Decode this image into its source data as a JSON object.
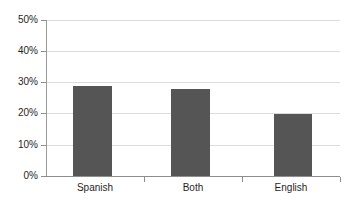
{
  "chart_data": {
    "type": "bar",
    "title": "",
    "xlabel": "",
    "ylabel": "",
    "categories": [
      "Spanish",
      "Both",
      "English"
    ],
    "values": [
      29,
      28,
      20
    ],
    "value_labels": [
      "29%",
      "28%",
      "20%"
    ],
    "series": [
      {
        "name": "",
        "values": [
          29,
          28,
          20
        ]
      }
    ],
    "ylim": [
      0,
      50
    ],
    "ytick_values": [
      50,
      40,
      30,
      20,
      10,
      0
    ],
    "ytick_labels": [
      "50%",
      "40%",
      "30%",
      "20%",
      "10%",
      "0%"
    ],
    "grid": true,
    "grid_axis": "y",
    "legend": false,
    "legend_position": "none",
    "bar_color": "#555555",
    "gridline_color": "#dcdcdc",
    "axis_color": "#8e8e8e",
    "background_color": "#ffffff"
  }
}
